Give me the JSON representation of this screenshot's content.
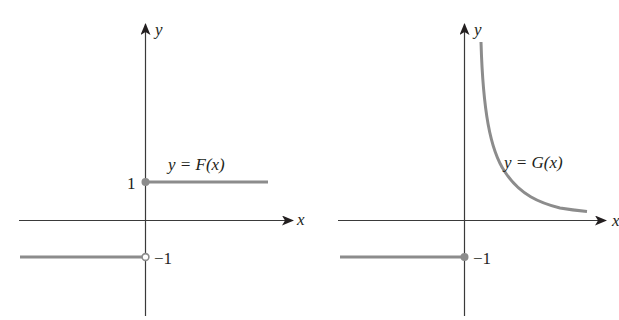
{
  "figure": {
    "panels": [
      {
        "id": "F",
        "x_axis_label": "x",
        "y_axis_label": "y",
        "function_label": "y = F(x)",
        "tick_labels": {
          "upper": "1",
          "lower": "−1"
        },
        "description": "Step function: F(x) = 1 for x >= 0 (filled dot at (0,1)), F(x) = -1 for x < 0 (open dot at (0,-1))"
      },
      {
        "id": "G",
        "x_axis_label": "x",
        "y_axis_label": "y",
        "function_label": "y = G(x)",
        "tick_labels": {
          "lower": "−1"
        },
        "description": "G(x) = -1 for x <= 0 (filled dot at (0,-1)); for x > 0 a decreasing curve approaching the x-axis, unbounded as x -> 0+"
      }
    ],
    "colors": {
      "axis": "#3a3a3a",
      "curve": "#8c8c8c",
      "text": "#231f20",
      "background": "#ffffff"
    }
  }
}
